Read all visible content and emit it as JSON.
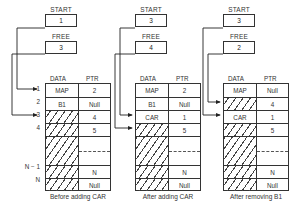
{
  "labels": {
    "start": "START",
    "free": "FREE",
    "data_header": "DATA",
    "ptr_header": "PTR"
  },
  "row_index_labels": [
    "1",
    "2",
    "3",
    "4",
    "",
    "N − 1",
    "N"
  ],
  "panels": [
    {
      "caption": "Before adding CAR",
      "start": "1",
      "free": "3",
      "rows": [
        {
          "data": "MAP",
          "ptr": "2",
          "free_slot": false
        },
        {
          "data": "B1",
          "ptr": "Null",
          "free_slot": false
        },
        {
          "data": "",
          "ptr": "4",
          "free_slot": true
        },
        {
          "data": "",
          "ptr": "5",
          "free_slot": true
        },
        {
          "data": "",
          "ptr": "",
          "free_slot": true,
          "gap": true
        },
        {
          "data": "",
          "ptr": "N",
          "free_slot": true
        },
        {
          "data": "",
          "ptr": "Null",
          "free_slot": true
        }
      ]
    },
    {
      "caption": "After adding CAR",
      "start": "3",
      "free": "4",
      "rows": [
        {
          "data": "MAP",
          "ptr": "2",
          "free_slot": false
        },
        {
          "data": "B1",
          "ptr": "Null",
          "free_slot": false
        },
        {
          "data": "CAR",
          "ptr": "1",
          "free_slot": false
        },
        {
          "data": "",
          "ptr": "5",
          "free_slot": true
        },
        {
          "data": "",
          "ptr": "",
          "free_slot": true,
          "gap": true
        },
        {
          "data": "",
          "ptr": "N",
          "free_slot": true
        },
        {
          "data": "",
          "ptr": "Null",
          "free_slot": true
        }
      ]
    },
    {
      "caption": "After removing B1",
      "start": "3",
      "free": "2",
      "rows": [
        {
          "data": "MAP",
          "ptr": "Null",
          "free_slot": false
        },
        {
          "data": "",
          "ptr": "4",
          "free_slot": true
        },
        {
          "data": "CAR",
          "ptr": "1",
          "free_slot": false
        },
        {
          "data": "",
          "ptr": "5",
          "free_slot": true
        },
        {
          "data": "",
          "ptr": "",
          "free_slot": true,
          "gap": true
        },
        {
          "data": "",
          "ptr": "N",
          "free_slot": true
        },
        {
          "data": "",
          "ptr": "Null",
          "free_slot": true
        }
      ]
    }
  ]
}
